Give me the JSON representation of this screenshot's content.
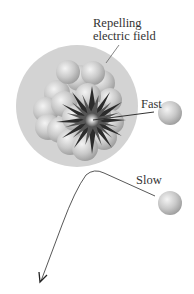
{
  "diagram": {
    "labels": {
      "field_line1": "Repelling",
      "field_line2": "electric field",
      "fast": "Fast",
      "slow": "Slow"
    },
    "colors": {
      "field": "#d4d4d4",
      "nucleon": "#c8c8c8",
      "burst": "#2b2b2b",
      "line": "#555555"
    }
  }
}
